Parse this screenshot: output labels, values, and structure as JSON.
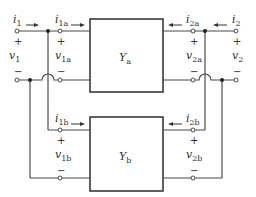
{
  "diagram": {
    "networks": [
      {
        "id": "a",
        "symbol": "Y",
        "subscript": "a"
      },
      {
        "id": "b",
        "symbol": "Y",
        "subscript": "b"
      }
    ],
    "labels": {
      "i1": {
        "sym": "i",
        "sub": "1"
      },
      "i2": {
        "sym": "i",
        "sub": "2"
      },
      "v1": {
        "sym": "v",
        "sub": "1"
      },
      "v2": {
        "sym": "v",
        "sub": "2"
      },
      "i1a": {
        "sym": "i",
        "sub": "1a"
      },
      "i2a": {
        "sym": "i",
        "sub": "2a"
      },
      "v1a": {
        "sym": "v",
        "sub": "1a"
      },
      "v2a": {
        "sym": "v",
        "sub": "2a"
      },
      "i1b": {
        "sym": "i",
        "sub": "1b"
      },
      "i2b": {
        "sym": "i",
        "sub": "2b"
      },
      "v1b": {
        "sym": "v",
        "sub": "1b"
      },
      "v2b": {
        "sym": "v",
        "sub": "2b"
      }
    },
    "signs": {
      "plus": "+",
      "minus": "−"
    }
  }
}
